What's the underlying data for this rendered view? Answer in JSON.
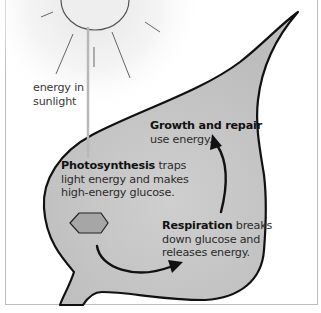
{
  "diagram": {
    "sun_label": {
      "line1": "energy in",
      "line2": "sunlight"
    },
    "growth": {
      "bold": "Growth and repair",
      "line2": "use energy."
    },
    "photosynthesis": {
      "bold": "Photosynthesis",
      "rest1": " traps",
      "line2": "light energy and makes",
      "line3": "high-energy glucose."
    },
    "respiration": {
      "bold": "Respiration",
      "rest1": " breaks",
      "line2": "down glucose and",
      "line3": "releases energy."
    },
    "icons": {
      "sun": "sun-icon",
      "glucose": "hexagon-glucose-icon",
      "arrow_photo_to_resp": "curved-arrow-icon",
      "arrow_resp_to_growth": "curved-arrow-icon"
    },
    "colors": {
      "leaf_fill": "#c9c9c9",
      "leaf_outline": "#111111",
      "hexagon_fill": "#a8a8a8",
      "sun_fill": "#eeeeee",
      "beam": "#bbbbbb",
      "text": "#2b2b2b"
    }
  }
}
